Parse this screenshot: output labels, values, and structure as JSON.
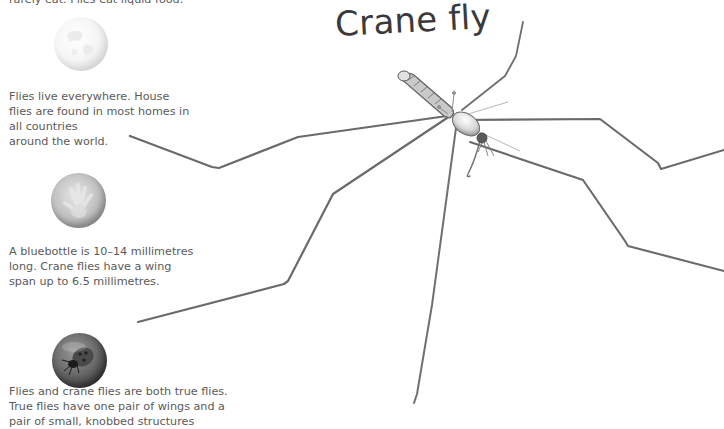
{
  "page": {
    "title": "Crane fly",
    "paragraphs": [
      {
        "id": "diet",
        "text": "rarely eat. Flies eat liquid food."
      },
      {
        "id": "habitat",
        "text": "Flies live everywhere. House\nflies are found in most homes in\nall countries\naround the world."
      },
      {
        "id": "size",
        "text": "A bluebottle is 10–14 millimetres\nlong. Crane flies have a wing\nspan up to 6.5 millimetres."
      },
      {
        "id": "classification",
        "text": "Flies and crane flies are both true flies.\nTrue flies have one pair of wings and a\npair of small, knobbed structures"
      }
    ],
    "icons": [
      {
        "name": "globe-icon",
        "description": "pale white globe bubble"
      },
      {
        "name": "hand-icon",
        "description": "grey bubble with a hand print"
      },
      {
        "name": "ladybird-icon",
        "description": "dark bubble with a beetle"
      }
    ],
    "illustration": {
      "subject": "crane fly",
      "style": "grey pencil-like 3D render on white"
    },
    "colors": {
      "background": "#ffffff",
      "body_text": "#5a5a5a",
      "title_text": "#3a3a3a",
      "leg_stroke": "#6e6e6e"
    }
  }
}
